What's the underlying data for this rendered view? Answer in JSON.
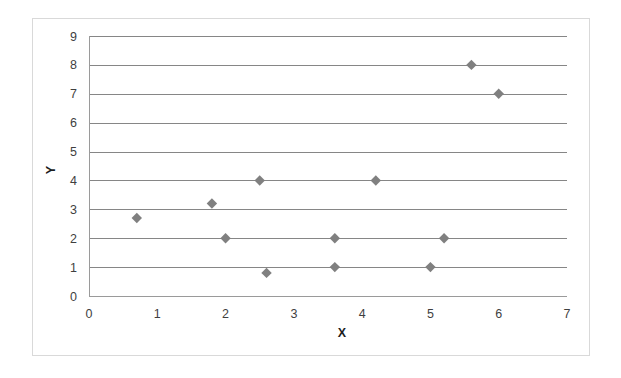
{
  "chart_data": {
    "type": "scatter",
    "title": "",
    "xlabel": "X",
    "ylabel": "Y",
    "xlim": [
      0,
      7
    ],
    "ylim": [
      0,
      9
    ],
    "xticks": [
      "0",
      "1",
      "2",
      "3",
      "4",
      "5",
      "6",
      "7"
    ],
    "yticks": [
      "0",
      "1",
      "2",
      "3",
      "4",
      "5",
      "6",
      "7",
      "8",
      "9"
    ],
    "grid": "horizontal",
    "legend": "none",
    "marker_shape": "diamond",
    "marker_color": "#808080",
    "gridline_color": "#868686",
    "border_color": "#d9d9d9",
    "series": [
      {
        "name": "series-1",
        "points": [
          {
            "x": 0.7,
            "y": 2.7
          },
          {
            "x": 1.8,
            "y": 3.2
          },
          {
            "x": 2.0,
            "y": 2.0
          },
          {
            "x": 2.5,
            "y": 4.0
          },
          {
            "x": 2.6,
            "y": 0.8
          },
          {
            "x": 3.6,
            "y": 2.0
          },
          {
            "x": 3.6,
            "y": 1.0
          },
          {
            "x": 4.2,
            "y": 4.0
          },
          {
            "x": 5.0,
            "y": 1.0
          },
          {
            "x": 5.2,
            "y": 2.0
          },
          {
            "x": 5.6,
            "y": 8.0
          },
          {
            "x": 6.0,
            "y": 7.0
          }
        ]
      }
    ]
  }
}
